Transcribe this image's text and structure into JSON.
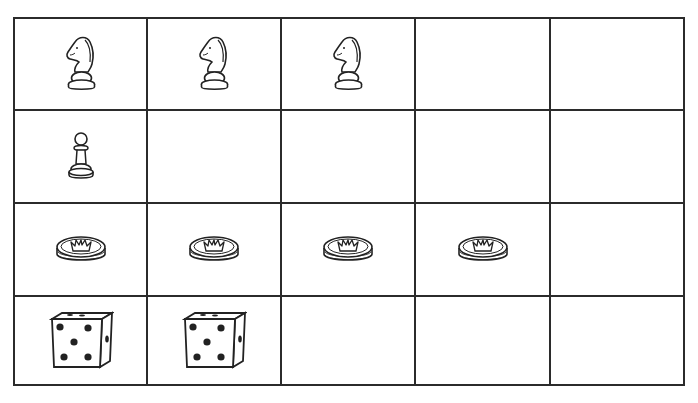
{
  "board": {
    "rows": 4,
    "columns": 5,
    "cells": [
      [
        "knight",
        "knight",
        "knight",
        "",
        ""
      ],
      [
        "pawn",
        "",
        "",
        "",
        ""
      ],
      [
        "crown-token",
        "crown-token",
        "crown-token",
        "crown-token",
        ""
      ],
      [
        "die-5",
        "die-5",
        "",
        "",
        ""
      ]
    ]
  },
  "colors": {
    "line": "#2b2b2b",
    "background": "#ffffff"
  }
}
